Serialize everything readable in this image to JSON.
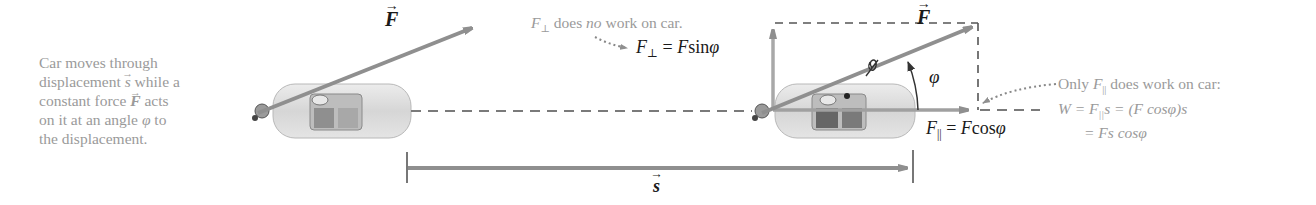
{
  "caption_left": {
    "line1": "Car moves through",
    "line2_pre": "displacement ",
    "line2_vec": "s",
    "line2_post": " while a",
    "line3_pre": "constant force ",
    "line3_vec": "F",
    "line3_post": " acts",
    "line4_pre": "on it at an angle ",
    "line4_sym": "φ",
    "line4_post": " to",
    "line5": "the displacement."
  },
  "force_label_left": "F",
  "force_label_right": "F",
  "perp_note": {
    "sym": "F",
    "sub": "⊥",
    "pre": " does ",
    "emph": "no",
    "post": " work on car."
  },
  "perp_eq": {
    "lhs": "F",
    "sub": "⊥",
    "eq": " = ",
    "rhs_sym": "F",
    "rhs_fn": "sin",
    "rhs_angle": "φ"
  },
  "angle_label": "φ",
  "par_eq": {
    "lhs": "F",
    "sub": "||",
    "eq": " = ",
    "rhs_sym": "F",
    "rhs_fn": "cos",
    "rhs_angle": "φ"
  },
  "work_note": {
    "line1_pre": "Only ",
    "line1_sym": "F",
    "line1_sub": "||",
    "line1_post": " does work on car:",
    "line2": "W = F",
    "line2_sub": "||",
    "line2_post": "s = (F cosφ)s",
    "line3": "= Fs cosφ"
  },
  "displacement_label": "s",
  "colors": {
    "arrow": "#8f8f8f",
    "dashed": "#7a7a7a",
    "caption_text": "#9a9a9a",
    "label_text": "#1a1a1a",
    "car_body": "#d8d8d8"
  }
}
